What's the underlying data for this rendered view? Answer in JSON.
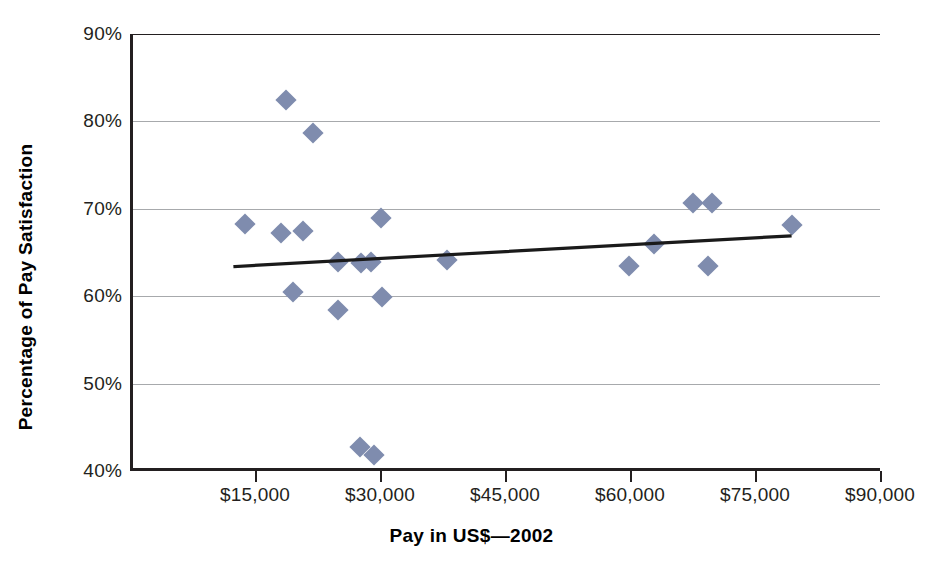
{
  "chart_data": {
    "type": "scatter",
    "title": "",
    "xlabel": "Pay in US$—2002",
    "ylabel": "Percentage of Pay Satisfaction",
    "xlim": [
      0,
      90000
    ],
    "ylim": [
      40,
      90
    ],
    "grid": true,
    "legend_position": "none",
    "marker_color": "#7f8cae",
    "trendline_color": "#1a1a1a",
    "gridline_color": "#a7a9ac",
    "axis_color": "#231f20",
    "x_ticks": [
      {
        "value": 15000,
        "label": "$15,000"
      },
      {
        "value": 30000,
        "label": "$30,000"
      },
      {
        "value": 45000,
        "label": "$45,000"
      },
      {
        "value": 60000,
        "label": "$60,000"
      },
      {
        "value": 75000,
        "label": "$75,000"
      },
      {
        "value": 90000,
        "label": "$90,000"
      }
    ],
    "y_ticks": [
      {
        "value": 40,
        "label": "40%"
      },
      {
        "value": 50,
        "label": "50%"
      },
      {
        "value": 60,
        "label": "60%"
      },
      {
        "value": 70,
        "label": "70%"
      },
      {
        "value": 80,
        "label": "80%"
      },
      {
        "value": 90,
        "label": "90%"
      }
    ],
    "points": [
      {
        "x": 18400,
        "y": 82.5
      },
      {
        "x": 21600,
        "y": 78.7
      },
      {
        "x": 13400,
        "y": 68.3
      },
      {
        "x": 17800,
        "y": 67.2
      },
      {
        "x": 20400,
        "y": 67.5
      },
      {
        "x": 29700,
        "y": 68.9
      },
      {
        "x": 19200,
        "y": 60.5
      },
      {
        "x": 24600,
        "y": 58.4
      },
      {
        "x": 29900,
        "y": 59.9
      },
      {
        "x": 24600,
        "y": 63.9
      },
      {
        "x": 27400,
        "y": 63.8
      },
      {
        "x": 28600,
        "y": 63.9
      },
      {
        "x": 37700,
        "y": 64.1
      },
      {
        "x": 59500,
        "y": 63.4
      },
      {
        "x": 62500,
        "y": 66.0
      },
      {
        "x": 67200,
        "y": 70.7
      },
      {
        "x": 69500,
        "y": 70.7
      },
      {
        "x": 69000,
        "y": 63.5
      },
      {
        "x": 79100,
        "y": 68.2
      },
      {
        "x": 27200,
        "y": 42.8
      },
      {
        "x": 28900,
        "y": 41.8
      }
    ],
    "trendline": {
      "x_start": 12600,
      "y_start": 63.4,
      "x_end": 79200,
      "y_end": 66.9
    }
  }
}
